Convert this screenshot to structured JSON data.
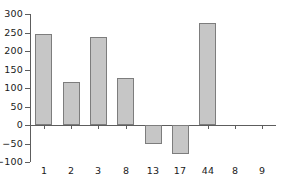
{
  "chart_data": {
    "type": "bar",
    "title": "",
    "subtitle": "",
    "xlabel": "",
    "ylabel": "",
    "categories": [
      "1",
      "2",
      "3",
      "8",
      "13",
      "17",
      "44",
      "8",
      "9"
    ],
    "values": [
      245,
      115,
      238,
      128,
      -50,
      -78,
      275,
      0,
      0
    ],
    "series": [
      {
        "name": "",
        "values": [
          245,
          115,
          238,
          128,
          -50,
          -78,
          275,
          0,
          0
        ]
      }
    ],
    "ylim": [
      -100,
      300
    ],
    "yticks": [
      300,
      250,
      200,
      150,
      100,
      50,
      0,
      -50,
      -100
    ],
    "ytick_labels": [
      "300",
      "250",
      "200",
      "150",
      "100",
      "50",
      "0",
      "−50",
      "−100"
    ],
    "grid": false,
    "legend": null,
    "legend_position": "none",
    "bar_fill_color": "#c6c6c6",
    "bar_edge_color": "#7d7d7d",
    "axis_color": "#5d5d5d",
    "background_color": "#ffffff",
    "baseline_value": 0,
    "annotations": []
  }
}
